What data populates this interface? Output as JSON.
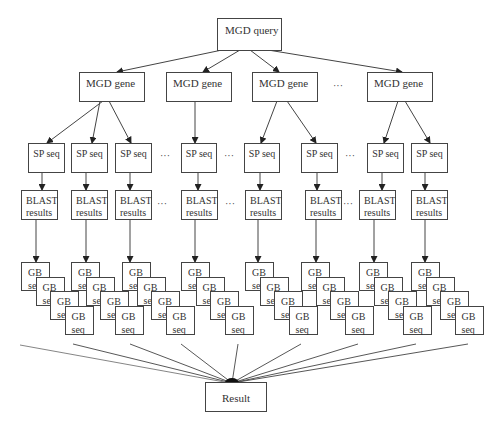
{
  "diagram": {
    "type": "tree-flowchart",
    "root": {
      "label": "MGD query"
    },
    "level1": {
      "label": "MGD gene",
      "nodes": [
        "MGD gene",
        "MGD gene",
        "MGD gene",
        "MGD gene"
      ],
      "ellipsis": "…"
    },
    "level2": {
      "label": "SP seq",
      "nodes": [
        "SP seq",
        "SP seq",
        "SP seq",
        "SP seq",
        "SP seq",
        "SP seq",
        "SP seq",
        "SP seq"
      ],
      "ellipsis": "…"
    },
    "level3": {
      "label_line1": "BLAST",
      "label_line2": "results",
      "nodes": [
        "BLAST results",
        "BLAST results",
        "BLAST results",
        "BLAST results",
        "BLAST results",
        "BLAST results",
        "BLAST results",
        "BLAST results"
      ],
      "ellipsis": "…"
    },
    "level4": {
      "label": "GB seq",
      "stacks": 8,
      "per_stack": 4
    },
    "sink": {
      "label": "Result"
    }
  },
  "labels": {
    "query": "MGD query",
    "gene": "MGD gene",
    "sp": "SP seq",
    "blast": "BLAST results",
    "gb": "GB seq",
    "result": "Result",
    "dots": "···"
  }
}
